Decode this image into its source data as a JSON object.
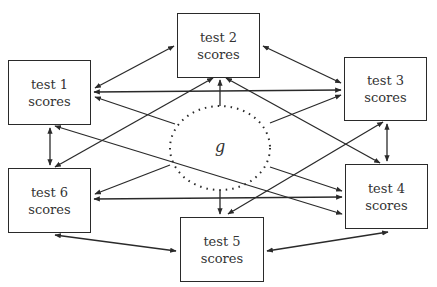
{
  "diagram": {
    "type": "latent-factor-network",
    "central_factor": {
      "label": "g",
      "style": "dotted ellipse"
    },
    "nodes": [
      {
        "id": "test1",
        "line1": "test 1",
        "line2": "scores"
      },
      {
        "id": "test2",
        "line1": "test 2",
        "line2": "scores"
      },
      {
        "id": "test3",
        "line1": "test 3",
        "line2": "scores"
      },
      {
        "id": "test4",
        "line1": "test 4",
        "line2": "scores"
      },
      {
        "id": "test5",
        "line1": "test 5",
        "line2": "scores"
      },
      {
        "id": "test6",
        "line1": "test 6",
        "line2": "scores"
      }
    ],
    "edges": [
      {
        "from": "g",
        "to": "test1",
        "directed": true
      },
      {
        "from": "g",
        "to": "test2",
        "directed": true
      },
      {
        "from": "g",
        "to": "test3",
        "directed": true
      },
      {
        "from": "g",
        "to": "test4",
        "directed": true
      },
      {
        "from": "g",
        "to": "test5",
        "directed": true
      },
      {
        "from": "g",
        "to": "test6",
        "directed": true
      },
      {
        "from": "test1",
        "to": "test2",
        "bidirectional": true
      },
      {
        "from": "test2",
        "to": "test3",
        "bidirectional": true
      },
      {
        "from": "test3",
        "to": "test4",
        "bidirectional": true
      },
      {
        "from": "test4",
        "to": "test5",
        "bidirectional": true
      },
      {
        "from": "test5",
        "to": "test6",
        "bidirectional": true
      },
      {
        "from": "test6",
        "to": "test1",
        "bidirectional": true
      },
      {
        "from": "test1",
        "to": "test3",
        "bidirectional": true
      },
      {
        "from": "test6",
        "to": "test4",
        "bidirectional": true
      },
      {
        "from": "test1",
        "to": "test4",
        "bidirectional": true
      },
      {
        "from": "test6",
        "to": "test3",
        "bidirectional": true
      },
      {
        "from": "test2",
        "to": "test4",
        "bidirectional": true
      },
      {
        "from": "test2",
        "to": "test6",
        "bidirectional": true
      },
      {
        "from": "test5",
        "to": "test1",
        "bidirectional": true
      },
      {
        "from": "test5",
        "to": "test3",
        "bidirectional": true
      }
    ],
    "colors": {
      "line": "#2a2a2a",
      "text": "#333333",
      "background": "#ffffff"
    }
  }
}
